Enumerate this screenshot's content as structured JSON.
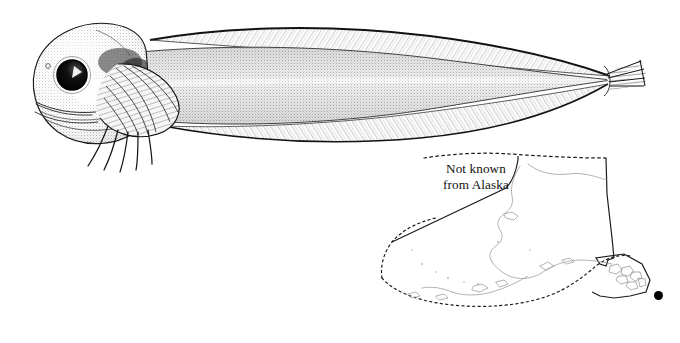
{
  "plate": {
    "background_color": "#ffffff",
    "ink_color": "#000000"
  },
  "illustration": {
    "name": "fish-lateral-view",
    "subject": "snailfish",
    "orientation": "left-facing lateral view",
    "technique": "stipple and line engraving",
    "features": [
      "large round eye with white highlight",
      "blunt rounded head",
      "fan-shaped pectoral fin",
      "free elongate lower pectoral rays",
      "long hatched dorsal fin",
      "long hatched anal fin",
      "tapered trunk",
      "small rayed caudal fin"
    ]
  },
  "map": {
    "name": "alaska-distribution-map",
    "region": "Alaska",
    "note_line_1": "Not known",
    "note_line_2": "from Alaska",
    "boundaries": {
      "state_border_style": "solid",
      "eez_border_style": "dotted",
      "coastline_style": "thin grey"
    }
  },
  "legend": {
    "dot_label": "occurrence-dot",
    "dot_color": "#000000"
  }
}
